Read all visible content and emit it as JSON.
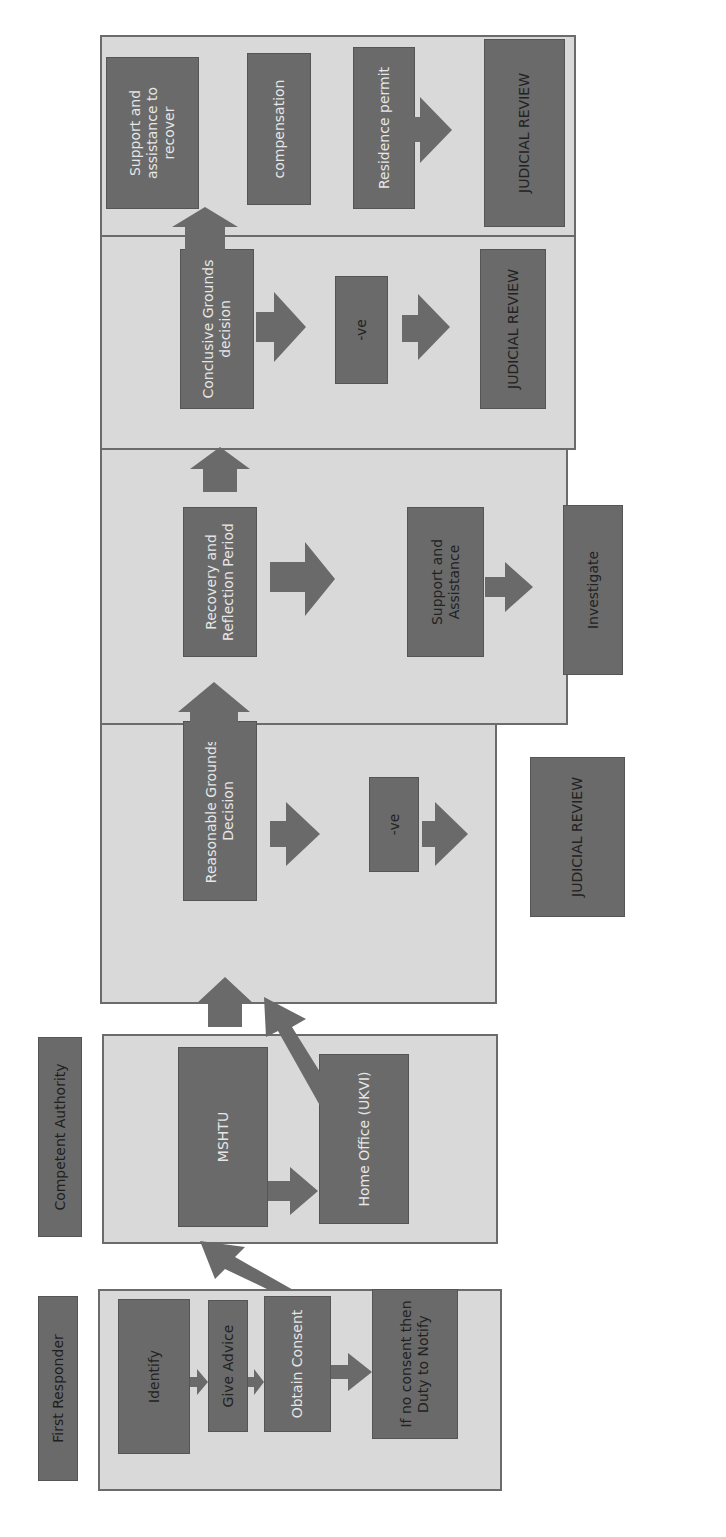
{
  "colors": {
    "panel_bg": "#d9d9d9",
    "panel_border": "#6b6b6b",
    "box_fill": "#6a6a6a",
    "arrow_fill": "#6a6a6a",
    "light_text": "#e6e6e6",
    "dark_text": "#222222"
  },
  "lanes": {
    "first_responder": "First Responder",
    "competent_authority": "Competent Authority"
  },
  "first_responder": {
    "identify": "Identify",
    "give_advice": "Give Advice",
    "obtain_consent": "Obtain Consent",
    "no_consent": "If no consent then Duty to Notify"
  },
  "competent_authority": {
    "mshtu": "MSHTU",
    "home_office": "Home Office (UKVI)"
  },
  "reasonable_grounds": {
    "decision": "Reasonable Grounds Decision",
    "negative": "-ve",
    "judicial_review": "JUDICIAL REVIEW"
  },
  "recovery": {
    "period": "Recovery and Reflection Period",
    "support": "Support and Assistance",
    "investigate": "Investigate",
    "positive_label": "+ve"
  },
  "conclusive_grounds": {
    "decision": "Conclusive Grounds decision",
    "negative": "-ve",
    "judicial_review": "JUDICIAL REVIEW"
  },
  "outcomes": {
    "support_recover": "Support and assistance to recover",
    "compensation": "compensation",
    "residence_permit": "Residence permit",
    "negative": "- ve",
    "judicial_review": "JUDICIAL REVIEW",
    "positive_label": "+ve"
  }
}
